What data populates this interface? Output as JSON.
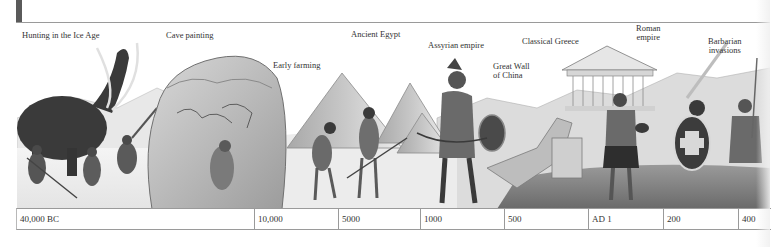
{
  "labels": [
    {
      "id": "hunting-ice-age",
      "text": "Hunting in the Ice Age",
      "x": 33,
      "y": 31,
      "lines": [
        "Hunting in the Ice Age"
      ]
    },
    {
      "id": "cave-painting",
      "text": "Cave painting",
      "x": 166,
      "y": 31,
      "lines": [
        "Cave painting"
      ]
    },
    {
      "id": "early-farming",
      "text": "Early farming",
      "x": 273,
      "y": 61,
      "lines": [
        "Early farming"
      ]
    },
    {
      "id": "ancient-egypt",
      "text": "Ancient Egypt",
      "x": 351,
      "y": 30,
      "lines": [
        "Ancient Egypt"
      ]
    },
    {
      "id": "assyrian-empire",
      "text": "Assyrian empire",
      "x": 428,
      "y": 41,
      "lines": [
        "Assyrian empire"
      ]
    },
    {
      "id": "great-wall-china",
      "text": "Great Wall of China",
      "x": 493,
      "y": 62,
      "lines": [
        "Great Wall",
        "of China"
      ]
    },
    {
      "id": "classical-greece",
      "text": "Classical Greece",
      "x": 522,
      "y": 37,
      "lines": [
        "Classical Greece"
      ]
    },
    {
      "id": "roman-empire",
      "text": "Roman empire",
      "x": 637,
      "y": 24,
      "lines": [
        "Roman",
        "empire"
      ]
    },
    {
      "id": "barbarian-invasions",
      "text": "Barbarian invasions",
      "x": 710,
      "y": 37,
      "lines": [
        "Barbarian",
        "invasions"
      ]
    }
  ],
  "timeline": {
    "cells": [
      {
        "label": "40,000 BC",
        "width": 238
      },
      {
        "label": "10,000",
        "width": 84
      },
      {
        "label": "5000",
        "width": 82
      },
      {
        "label": "1000",
        "width": 84
      },
      {
        "label": "500",
        "width": 84
      },
      {
        "label": "AD 1",
        "width": 75
      },
      {
        "label": "200",
        "width": 75
      },
      {
        "label": "400",
        "width": 32
      }
    ]
  },
  "scenes": [
    "mammoth-hunt",
    "cave-painting-rock",
    "farmers-tilling",
    "pyramids",
    "assyrian-warrior",
    "great-wall",
    "greek-temple",
    "roman-soldier",
    "barbarian-warriors"
  ]
}
